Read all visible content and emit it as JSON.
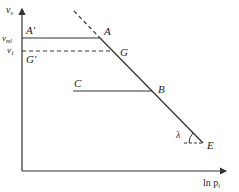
{
  "diagram": {
    "axes": {
      "y_label": "v",
      "y_label_sub": "s",
      "x_label": "ln p",
      "x_label_sub": "i"
    },
    "y_ticks": [
      {
        "label": "v",
        "sub": "ml"
      },
      {
        "label": "v",
        "sub": "1"
      }
    ],
    "points": {
      "A_prime": "A'",
      "A": "A",
      "G_prime": "G'",
      "G": "G",
      "C": "C",
      "B": "B",
      "E": "E"
    },
    "angle_label": "λ",
    "colors": {
      "line": "#333333",
      "background": "#ffffff"
    }
  }
}
